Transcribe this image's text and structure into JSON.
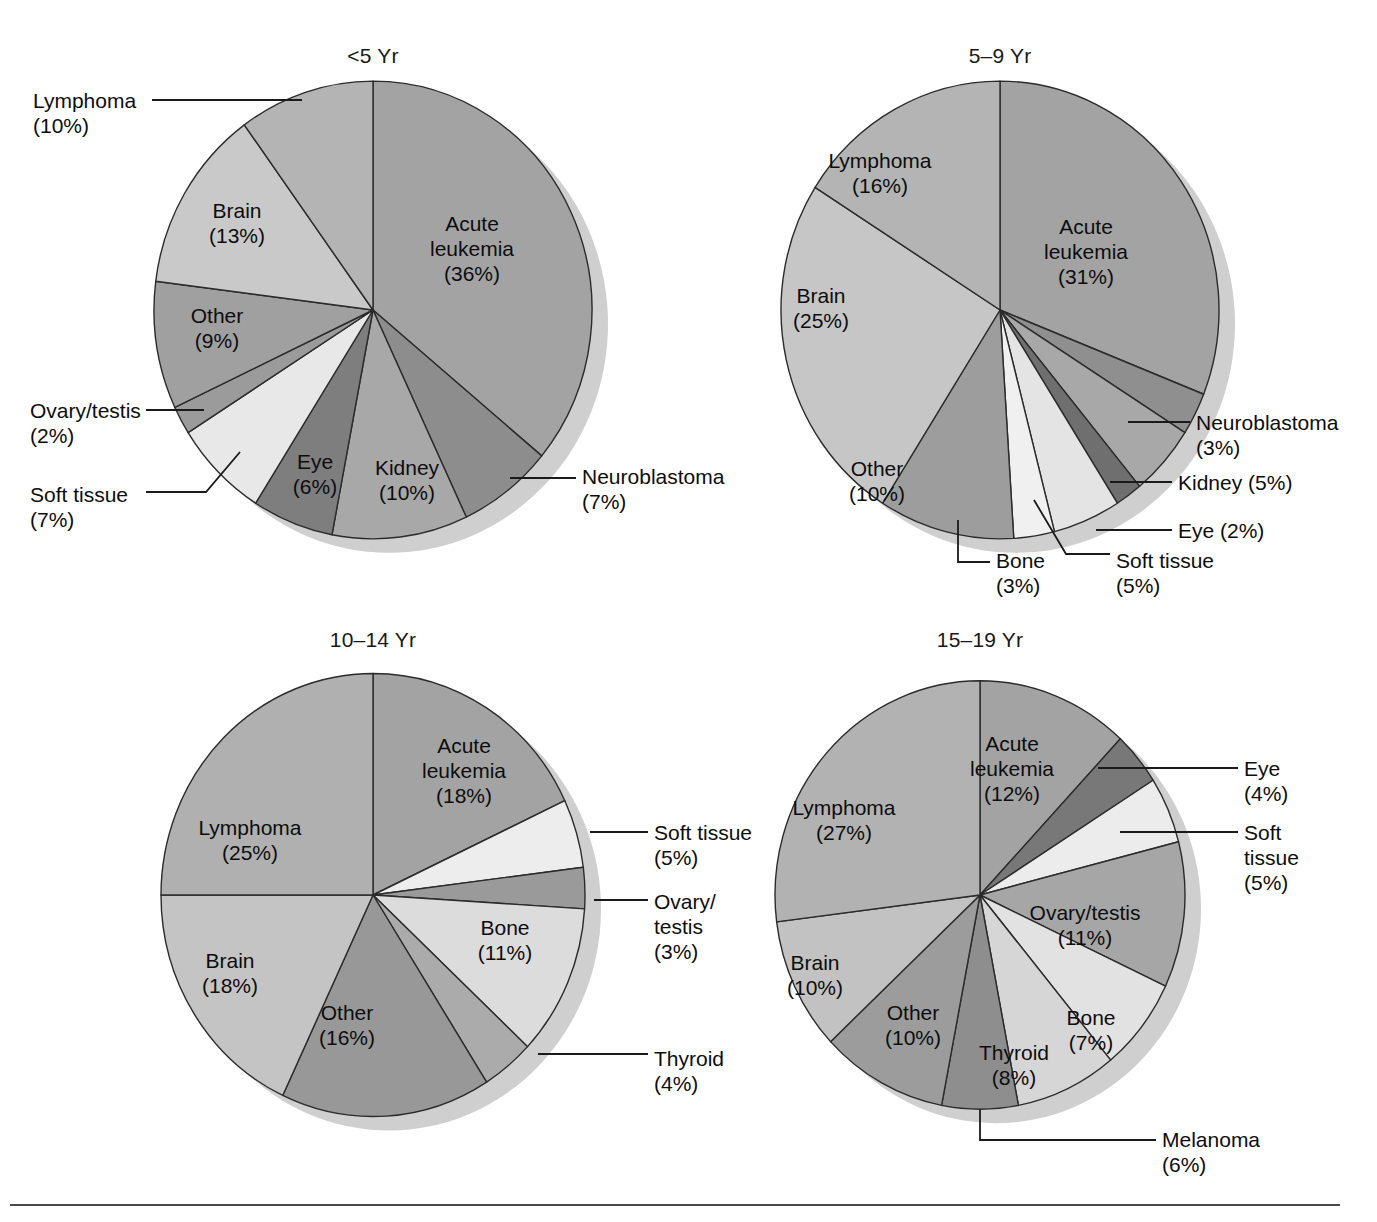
{
  "figure": {
    "background": "#ffffff",
    "rule_color": "#4a4a4a"
  },
  "chart_data": [
    {
      "type": "pie",
      "title": "<5 Yr",
      "center": [
        373,
        310
      ],
      "radius": 219,
      "start_angle_deg": 0,
      "legend": "labels on slices and leader lines",
      "categories": [
        "Acute leukemia",
        "Neuroblastoma",
        "Kidney",
        "Eye",
        "Soft tissue",
        "Ovary/testis",
        "Other",
        "Brain",
        "Lymphoma"
      ],
      "values": [
        36,
        7,
        10,
        6,
        7,
        2,
        9,
        13,
        10
      ],
      "colors": [
        "#a3a3a3",
        "#8d8d8d",
        "#a8a8a8",
        "#7e7e7e",
        "#e8e8e8",
        "#9b9b9b",
        "#a0a0a0",
        "#c9c9c9",
        "#b4b4b4"
      ],
      "labels": [
        {
          "name": "Acute leukemia",
          "text": "Acute\nleukemia\n(36%)",
          "percent": "36%",
          "placement": "inside"
        },
        {
          "name": "Neuroblastoma",
          "text": "Neuroblastoma\n(7%)",
          "percent": "7%",
          "placement": "leader-right"
        },
        {
          "name": "Kidney",
          "text": "Kidney\n(10%)",
          "percent": "10%",
          "placement": "inside"
        },
        {
          "name": "Eye",
          "text": "Eye\n(6%)",
          "percent": "6%",
          "placement": "inside"
        },
        {
          "name": "Soft tissue",
          "text": "Soft tissue\n(7%)",
          "percent": "7%",
          "placement": "leader-left"
        },
        {
          "name": "Ovary/testis",
          "text": "Ovary/testis\n(2%)",
          "percent": "2%",
          "placement": "leader-left"
        },
        {
          "name": "Other",
          "text": "Other\n(9%)",
          "percent": "9%",
          "placement": "inside"
        },
        {
          "name": "Brain",
          "text": "Brain\n(13%)",
          "percent": "13%",
          "placement": "inside"
        },
        {
          "name": "Lymphoma",
          "text": "Lymphoma\n(10%)",
          "percent": "10%",
          "placement": "leader-left"
        }
      ]
    },
    {
      "type": "pie",
      "title": "5–9 Yr",
      "center": [
        1000,
        310
      ],
      "radius": 219,
      "start_angle_deg": 0,
      "categories": [
        "Acute leukemia",
        "Neuroblastoma",
        "Kidney",
        "Eye",
        "Soft tissue",
        "Bone",
        "Other",
        "Brain",
        "Lymphoma"
      ],
      "values": [
        31,
        3,
        5,
        2,
        5,
        3,
        10,
        25,
        16
      ],
      "colors": [
        "#a3a3a3",
        "#8f8f8f",
        "#a8a8a8",
        "#6f6f6f",
        "#e4e4e4",
        "#f0f0f0",
        "#9d9d9d",
        "#c6c6c6",
        "#b4b4b4"
      ],
      "labels": [
        {
          "name": "Acute leukemia",
          "text": "Acute\nleukemia\n(31%)",
          "percent": "31%",
          "placement": "inside"
        },
        {
          "name": "Neuroblastoma",
          "text": "Neuroblastoma\n(3%)",
          "percent": "3%",
          "placement": "leader-right"
        },
        {
          "name": "Kidney",
          "text": "Kidney (5%)",
          "percent": "5%",
          "placement": "leader-right"
        },
        {
          "name": "Eye",
          "text": "Eye (2%)",
          "percent": "2%",
          "placement": "leader-right"
        },
        {
          "name": "Soft tissue",
          "text": "Soft tissue\n(5%)",
          "percent": "5%",
          "placement": "leader-bottom"
        },
        {
          "name": "Bone",
          "text": "Bone\n(3%)",
          "percent": "3%",
          "placement": "leader-bottom"
        },
        {
          "name": "Other",
          "text": "Other\n(10%)",
          "percent": "10%",
          "placement": "inside"
        },
        {
          "name": "Brain",
          "text": "Brain\n(25%)",
          "percent": "25%",
          "placement": "inside"
        },
        {
          "name": "Lymphoma",
          "text": "Lymphoma\n(16%)",
          "percent": "16%",
          "placement": "inside"
        }
      ]
    },
    {
      "type": "pie",
      "title": "10–14 Yr",
      "center": [
        373,
        895
      ],
      "radius": 212,
      "start_angle_deg": 0,
      "categories": [
        "Acute leukemia",
        "Soft tissue",
        "Ovary/testis",
        "Bone",
        "Thyroid",
        "Other",
        "Brain",
        "Lymphoma"
      ],
      "values": [
        18,
        5,
        3,
        11,
        4,
        16,
        18,
        25
      ],
      "colors": [
        "#a3a3a3",
        "#ededed",
        "#9a9a9a",
        "#dcdcdc",
        "#ababab",
        "#989898",
        "#c4c4c4",
        "#b0b0b0"
      ],
      "labels": [
        {
          "name": "Acute leukemia",
          "text": "Acute\nleukemia\n(18%)",
          "percent": "18%",
          "placement": "inside"
        },
        {
          "name": "Soft tissue",
          "text": "Soft tissue\n(5%)",
          "percent": "5%",
          "placement": "leader-right"
        },
        {
          "name": "Ovary/testis",
          "text": "Ovary/\ntestis\n(3%)",
          "percent": "3%",
          "placement": "leader-right"
        },
        {
          "name": "Bone",
          "text": "Bone\n(11%)",
          "percent": "11%",
          "placement": "inside"
        },
        {
          "name": "Thyroid",
          "text": "Thyroid\n(4%)",
          "percent": "4%",
          "placement": "leader-right"
        },
        {
          "name": "Other",
          "text": "Other\n(16%)",
          "percent": "16%",
          "placement": "inside"
        },
        {
          "name": "Brain",
          "text": "Brain\n(18%)",
          "percent": "18%",
          "placement": "inside"
        },
        {
          "name": "Lymphoma",
          "text": "Lymphoma\n(25%)",
          "percent": "25%",
          "placement": "inside"
        }
      ]
    },
    {
      "type": "pie",
      "title": "15–19 Yr",
      "center": [
        980,
        895
      ],
      "radius": 205,
      "start_angle_deg": 0,
      "categories": [
        "Acute leukemia",
        "Eye",
        "Soft tissue",
        "Ovary/testis",
        "Bone",
        "Thyroid",
        "Melanoma",
        "Other",
        "Brain",
        "Lymphoma"
      ],
      "values": [
        12,
        4,
        5,
        11,
        7,
        8,
        6,
        10,
        10,
        27
      ],
      "colors": [
        "#a3a3a3",
        "#787878",
        "#ececec",
        "#a6a6a6",
        "#e2e2e2",
        "#d6d6d6",
        "#8e8e8e",
        "#9c9c9c",
        "#c2c2c2",
        "#b2b2b2"
      ],
      "labels": [
        {
          "name": "Acute leukemia",
          "text": "Acute\nleukemia\n(12%)",
          "percent": "12%",
          "placement": "inside"
        },
        {
          "name": "Eye",
          "text": "Eye\n(4%)",
          "percent": "4%",
          "placement": "leader-right"
        },
        {
          "name": "Soft tissue",
          "text": "Soft\ntissue\n(5%)",
          "percent": "5%",
          "placement": "leader-right"
        },
        {
          "name": "Ovary/testis",
          "text": "Ovary/testis\n(11%)",
          "percent": "11%",
          "placement": "inside"
        },
        {
          "name": "Bone",
          "text": "Bone\n(7%)",
          "percent": "7%",
          "placement": "inside"
        },
        {
          "name": "Thyroid",
          "text": "Thyroid\n(8%)",
          "percent": "8%",
          "placement": "inside"
        },
        {
          "name": "Melanoma",
          "text": "Melanoma\n(6%)",
          "percent": "6%",
          "placement": "leader-bottom"
        },
        {
          "name": "Other",
          "text": "Other\n(10%)",
          "percent": "10%",
          "placement": "inside"
        },
        {
          "name": "Brain",
          "text": "Brain\n(10%)",
          "percent": "10%",
          "placement": "inside"
        },
        {
          "name": "Lymphoma",
          "text": "Lymphoma\n(27%)",
          "percent": "27%",
          "placement": "inside"
        }
      ]
    }
  ],
  "titles": {
    "t0": "<5 Yr",
    "t1": "5–9 Yr",
    "t2": "10–14 Yr",
    "t3": "15–19 Yr"
  },
  "text_labels": {
    "c0": {
      "acute_leukemia": "Acute\nleukemia\n(36%)",
      "neuroblastoma": "Neuroblastoma\n(7%)",
      "kidney": "Kidney\n(10%)",
      "eye": "Eye\n(6%)",
      "soft_tissue": "Soft tissue\n(7%)",
      "ovary_testis": "Ovary/testis\n(2%)",
      "other": "Other\n(9%)",
      "brain": "Brain\n(13%)",
      "lymphoma": "Lymphoma\n(10%)"
    },
    "c1": {
      "acute_leukemia": "Acute\nleukemia\n(31%)",
      "neuroblastoma": "Neuroblastoma\n(3%)",
      "kidney": "Kidney (5%)",
      "eye": "Eye (2%)",
      "soft_tissue": "Soft tissue\n(5%)",
      "bone": "Bone\n(3%)",
      "other": "Other\n(10%)",
      "brain": "Brain\n(25%)",
      "lymphoma": "Lymphoma\n(16%)"
    },
    "c2": {
      "acute_leukemia": "Acute\nleukemia\n(18%)",
      "soft_tissue": "Soft tissue\n(5%)",
      "ovary_testis": "Ovary/\ntestis\n(3%)",
      "bone": "Bone\n(11%)",
      "thyroid": "Thyroid\n(4%)",
      "other": "Other\n(16%)",
      "brain": "Brain\n(18%)",
      "lymphoma": "Lymphoma\n(25%)"
    },
    "c3": {
      "acute_leukemia": "Acute\nleukemia\n(12%)",
      "eye": "Eye\n(4%)",
      "soft_tissue": "Soft\ntissue\n(5%)",
      "ovary_testis": "Ovary/testis\n(11%)",
      "bone": "Bone\n(7%)",
      "thyroid": "Thyroid\n(8%)",
      "melanoma": "Melanoma\n(6%)",
      "other": "Other\n(10%)",
      "brain": "Brain\n(10%)",
      "lymphoma": "Lymphoma\n(27%)"
    }
  }
}
